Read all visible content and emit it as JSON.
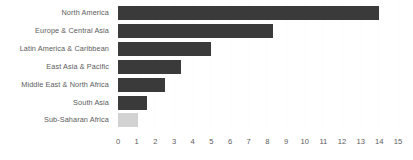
{
  "chart_data": {
    "type": "bar",
    "orientation": "horizontal",
    "title": "",
    "subtitle": "",
    "xlabel": "",
    "ylabel": "",
    "xlim": [
      0,
      15
    ],
    "ylim": null,
    "grid": true,
    "legend": null,
    "legend_position": "none",
    "xticks": [
      "0",
      "1",
      "2",
      "3",
      "4",
      "5",
      "6",
      "7",
      "8",
      "9",
      "10",
      "11",
      "12",
      "13",
      "14",
      "15"
    ],
    "categories": [
      "North America",
      "Europe & Central Asia",
      "Latin America & Caribbean",
      "East Asia & Pacific",
      "Middle East & North Africa",
      "South Asia",
      "Sub-Saharan Africa"
    ],
    "values": [
      14.0,
      8.3,
      5.0,
      3.4,
      2.5,
      1.55,
      1.05
    ],
    "bar_colors": [
      "#3a3a3a",
      "#3a3a3a",
      "#3a3a3a",
      "#3a3a3a",
      "#3a3a3a",
      "#3a3a3a",
      "#d2d2d2"
    ],
    "annotations": []
  },
  "style": {
    "background": "#ffffff",
    "bar_color": "#3a3a3a",
    "highlight_color": "#d2d2d2",
    "text_color": "#5c5c5c",
    "gridline_color": "#fbfbfb"
  }
}
